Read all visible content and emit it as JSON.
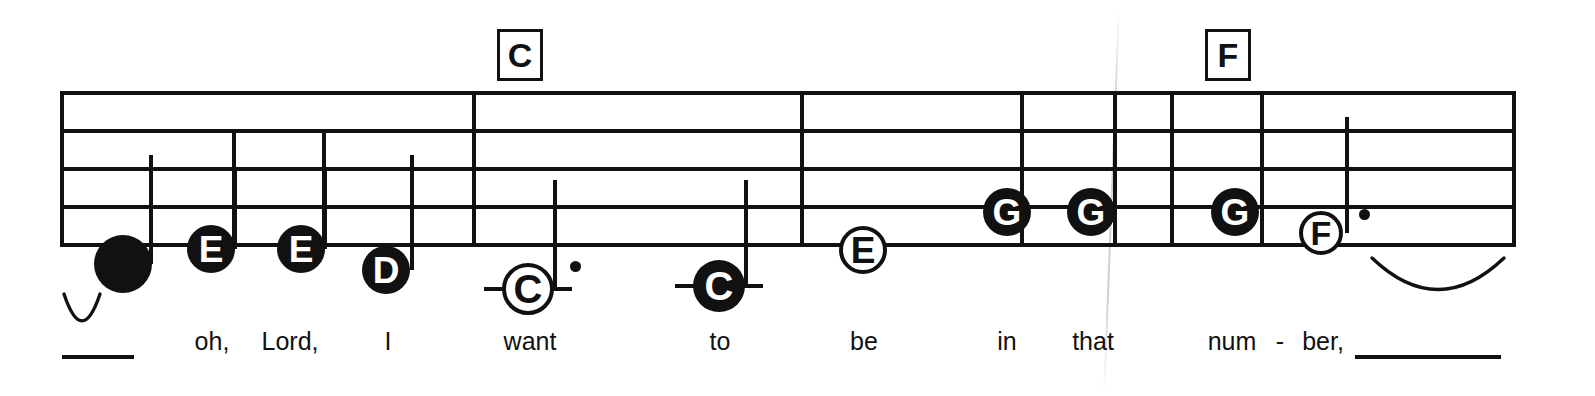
{
  "document": {
    "type": "shape-note-music-staff",
    "ink_color": "#111111",
    "background_color": "#ffffff"
  },
  "staff": {
    "line_count": 5,
    "left_x": 60,
    "right_x": 1512,
    "line_y": [
      91,
      129,
      167,
      205,
      243
    ]
  },
  "barlines": [
    {
      "name": "staff-start-barline",
      "x": 60,
      "top": 91,
      "bottom": 243
    },
    {
      "name": "barline-1",
      "x": 472,
      "top": 91,
      "bottom": 243
    },
    {
      "name": "barline-2",
      "x": 800,
      "top": 91,
      "bottom": 243
    },
    {
      "name": "barline-3",
      "x": 1170,
      "top": 91,
      "bottom": 243
    },
    {
      "name": "staff-end-barline",
      "x": 1512,
      "top": 91,
      "bottom": 243
    }
  ],
  "division_rules": [
    {
      "name": "division-rule-1",
      "x": 232,
      "top": 129,
      "bottom": 243
    },
    {
      "name": "division-rule-2",
      "x": 322,
      "top": 129,
      "bottom": 243
    },
    {
      "name": "division-rule-3",
      "x": 1020,
      "top": 91,
      "bottom": 243
    },
    {
      "name": "division-rule-4",
      "x": 1113,
      "top": 91,
      "bottom": 243
    },
    {
      "name": "division-rule-5",
      "x": 1260,
      "top": 91,
      "bottom": 243
    }
  ],
  "chords": [
    {
      "label": "C",
      "x": 497,
      "y": 29,
      "width": 46,
      "height": 52
    },
    {
      "label": "F",
      "x": 1205,
      "y": 29,
      "width": 46,
      "height": 52
    }
  ],
  "notes": [
    {
      "id": "n1",
      "letter": "",
      "head": "filled",
      "x": 123,
      "y": 264,
      "radius": 29,
      "stem": "up",
      "stem_x": 149,
      "stem_top": 155,
      "dotted": false,
      "ticks": false
    },
    {
      "id": "n2",
      "letter": "E",
      "head": "filled",
      "x": 211,
      "y": 249,
      "radius": 24,
      "stem": "up",
      "stem_x": 233,
      "stem_top": 167,
      "dotted": false,
      "ticks": false
    },
    {
      "id": "n3",
      "letter": "E",
      "head": "filled",
      "x": 301,
      "y": 249,
      "radius": 24,
      "stem": "up",
      "stem_x": 323,
      "stem_top": 167,
      "dotted": false,
      "ticks": false
    },
    {
      "id": "n4",
      "letter": "D",
      "head": "filled",
      "x": 386,
      "y": 270,
      "radius": 24,
      "stem": "up",
      "stem_x": 410,
      "stem_top": 155,
      "dotted": false,
      "ticks": false
    },
    {
      "id": "n5",
      "letter": "C",
      "head": "hollow",
      "x": 528,
      "y": 289,
      "radius": 26,
      "stem": "up",
      "stem_x": 553,
      "stem_top": 180,
      "dotted": true,
      "ticks": true
    },
    {
      "id": "n6",
      "letter": "C",
      "head": "filled",
      "x": 719,
      "y": 286,
      "radius": 26,
      "stem": "up",
      "stem_x": 744,
      "stem_top": 180,
      "dotted": false,
      "ticks": true
    },
    {
      "id": "n7",
      "letter": "E",
      "head": "hollow",
      "x": 863,
      "y": 250,
      "radius": 24,
      "stem": "none",
      "stem_x": 0,
      "stem_top": 0,
      "dotted": false,
      "ticks": false
    },
    {
      "id": "n8",
      "letter": "G",
      "head": "filled",
      "x": 1007,
      "y": 212,
      "radius": 24,
      "stem": "none",
      "stem_x": 0,
      "stem_top": 0,
      "dotted": false,
      "ticks": false
    },
    {
      "id": "n9",
      "letter": "G",
      "head": "filled",
      "x": 1091,
      "y": 212,
      "radius": 24,
      "stem": "none",
      "stem_x": 0,
      "stem_top": 0,
      "dotted": false,
      "ticks": false
    },
    {
      "id": "n10",
      "letter": "G",
      "head": "filled",
      "x": 1235,
      "y": 212,
      "radius": 24,
      "stem": "none",
      "stem_x": 0,
      "stem_top": 0,
      "dotted": false,
      "ticks": false
    },
    {
      "id": "n11",
      "letter": "F",
      "head": "hollow",
      "x": 1321,
      "y": 233,
      "radius": 22,
      "stem": "up",
      "stem_x": 1345,
      "stem_top": 117,
      "dotted": true,
      "ticks": false
    }
  ],
  "slurs": [
    {
      "name": "slur-start",
      "x": 62,
      "y": 292,
      "width": 40,
      "height": 36,
      "direction": "under"
    },
    {
      "name": "slur-end",
      "x": 1370,
      "y": 256,
      "width": 136,
      "height": 42,
      "direction": "under"
    }
  ],
  "lyrics": {
    "baseline_y": 345,
    "syllables": [
      {
        "text": "oh,",
        "x": 212
      },
      {
        "text": "Lord,",
        "x": 290
      },
      {
        "text": "I",
        "x": 388
      },
      {
        "text": "want",
        "x": 530
      },
      {
        "text": "to",
        "x": 720
      },
      {
        "text": "be",
        "x": 864
      },
      {
        "text": "in",
        "x": 1007
      },
      {
        "text": "that",
        "x": 1093
      },
      {
        "text": "num",
        "x": 1232
      },
      {
        "text": "-",
        "x": 1280
      },
      {
        "text": "ber,",
        "x": 1323
      }
    ],
    "extenders": [
      {
        "name": "lyric-extender-start",
        "x": 62,
        "y": 355,
        "width": 72
      },
      {
        "name": "lyric-extender-end",
        "x": 1355,
        "y": 355,
        "width": 146
      }
    ]
  }
}
